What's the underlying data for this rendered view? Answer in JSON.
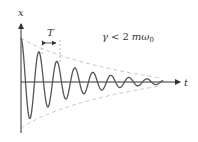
{
  "diagram": {
    "axes": {
      "y_label": "x",
      "x_label": "t"
    },
    "period_label": "T",
    "condition": {
      "gamma": "γ",
      "relation": "<",
      "rhs": "2",
      "m": "m",
      "omega": "ω",
      "subscript": "0"
    },
    "colors": {
      "curve": "#555555",
      "envelope": "#c8c8c8",
      "axis": "#333333"
    }
  }
}
